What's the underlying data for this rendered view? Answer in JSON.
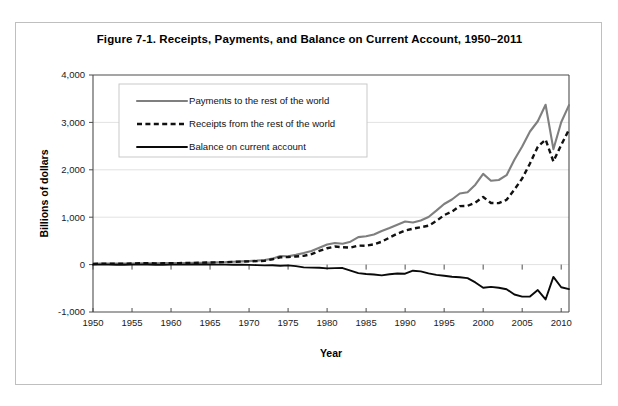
{
  "figure": {
    "title": "Figure 7-1. Receipts, Payments, and Balance on Current Account, 1950–2011"
  },
  "chart_data": {
    "type": "line",
    "title": "Figure 7-1. Receipts, Payments, and Balance on Current Account, 1950–2011",
    "xlabel": "Year",
    "ylabel": "Billions of dollars",
    "xlim": [
      1950,
      2011
    ],
    "ylim": [
      -1000,
      4000
    ],
    "xticks": [
      1950,
      1955,
      1960,
      1965,
      1970,
      1975,
      1980,
      1985,
      1990,
      1995,
      2000,
      2005,
      2010
    ],
    "xtick_labels": [
      "1950",
      "1955",
      "1960",
      "1965",
      "1970",
      "1975",
      "1980",
      "1985",
      "1990",
      "1995",
      "2000",
      "2005",
      "2010"
    ],
    "yticks": [
      -1000,
      0,
      1000,
      2000,
      3000,
      4000
    ],
    "ytick_labels": [
      "-1,000",
      "0",
      "1,000",
      "2,000",
      "3,000",
      "4,000"
    ],
    "grid": true,
    "legend_position": "upper-left-inset",
    "x": [
      1950,
      1951,
      1952,
      1953,
      1954,
      1955,
      1956,
      1957,
      1958,
      1959,
      1960,
      1961,
      1962,
      1963,
      1964,
      1965,
      1966,
      1967,
      1968,
      1969,
      1970,
      1971,
      1972,
      1973,
      1974,
      1975,
      1976,
      1977,
      1978,
      1979,
      1980,
      1981,
      1982,
      1983,
      1984,
      1985,
      1986,
      1987,
      1988,
      1989,
      1990,
      1991,
      1992,
      1993,
      1994,
      1995,
      1996,
      1997,
      1998,
      1999,
      2000,
      2001,
      2002,
      2003,
      2004,
      2005,
      2006,
      2007,
      2008,
      2009,
      2010,
      2011
    ],
    "series": [
      {
        "name": "Payments to the rest of the world",
        "style": "solid",
        "color": "#7f7f7f",
        "values": [
          15,
          20,
          21,
          22,
          22,
          24,
          27,
          29,
          28,
          32,
          32,
          32,
          35,
          36,
          38,
          43,
          49,
          53,
          61,
          67,
          74,
          84,
          98,
          126,
          179,
          176,
          205,
          243,
          285,
          354,
          424,
          456,
          440,
          483,
          579,
          597,
          636,
          710,
          773,
          841,
          910,
          887,
          931,
          1005,
          1138,
          1279,
          1373,
          1500,
          1526,
          1685,
          1914,
          1770,
          1785,
          1887,
          2213,
          2492,
          2808,
          3024,
          3373,
          2435,
          3003,
          3365
        ]
      },
      {
        "name": "Receipts from the rest of the world",
        "style": "dashed",
        "color": "#111111",
        "values": [
          14,
          19,
          20,
          20,
          20,
          23,
          27,
          30,
          26,
          27,
          31,
          32,
          34,
          37,
          42,
          45,
          49,
          52,
          58,
          64,
          69,
          73,
          81,
          113,
          155,
          159,
          172,
          185,
          221,
          288,
          345,
          381,
          367,
          357,
          400,
          398,
          427,
          483,
          570,
          652,
          718,
          758,
          789,
          820,
          920,
          1044,
          1118,
          1234,
          1240,
          1309,
          1427,
          1300,
          1297,
          1367,
          1582,
          1816,
          2134,
          2486,
          2638,
          2176,
          2524,
          2848
        ]
      },
      {
        "name": "Balance on current account",
        "style": "solid-bold",
        "color": "#0a0a0a",
        "values": [
          -1,
          -1,
          -1,
          -2,
          -2,
          -1,
          0,
          1,
          -2,
          -5,
          -1,
          0,
          -1,
          1,
          4,
          2,
          0,
          -1,
          -3,
          -3,
          -5,
          -11,
          -17,
          -13,
          -24,
          -17,
          -33,
          -58,
          -64,
          -66,
          -79,
          -75,
          -73,
          -126,
          -179,
          -199,
          -209,
          -227,
          -203,
          -189,
          -192,
          -129,
          -142,
          -185,
          -218,
          -235,
          -255,
          -266,
          -286,
          -376,
          -487,
          -470,
          -488,
          -520,
          -631,
          -676,
          -674,
          -538,
          -735,
          -259,
          -479,
          -517
        ]
      }
    ]
  },
  "axes": {
    "x_title": "Year",
    "y_title": "Billions of dollars"
  },
  "legend": {
    "items": [
      {
        "label": "Payments to the rest of the world",
        "marker": "solid-gray-line"
      },
      {
        "label": "Receipts from the rest of the world",
        "marker": "dashed-black-line"
      },
      {
        "label": "Balance on current account",
        "marker": "solid-black-line"
      }
    ]
  }
}
